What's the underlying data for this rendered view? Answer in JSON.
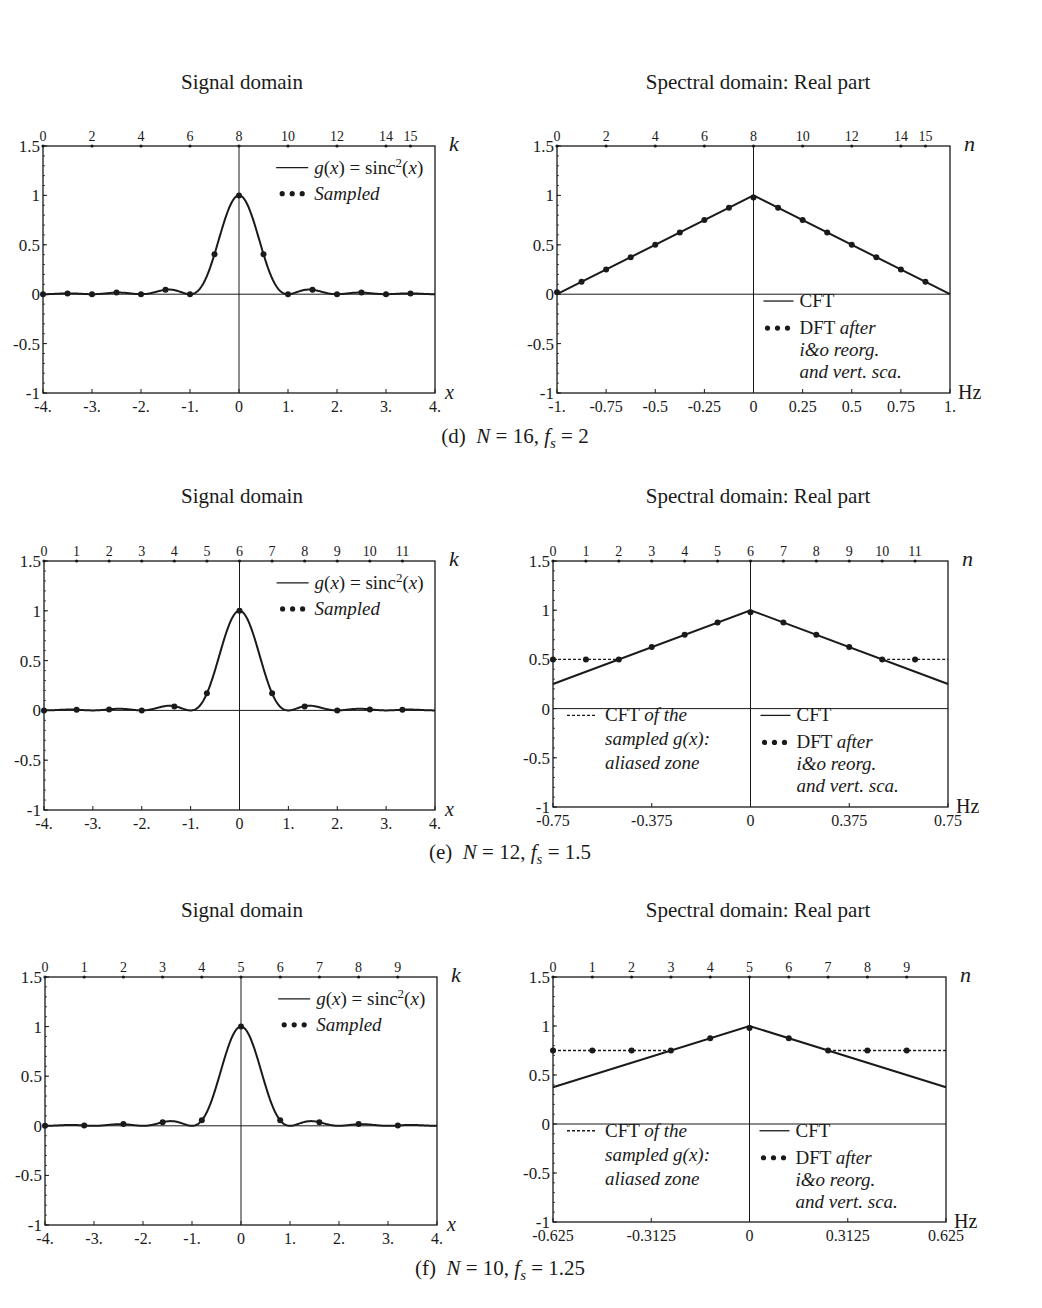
{
  "panels": [
    {
      "id": "d",
      "caption": {
        "label": "(d)",
        "N": "16",
        "fs": "2"
      },
      "signal": {
        "title": "Signal domain"
      },
      "spectral": {
        "title": "Spectral domain: Real part"
      }
    },
    {
      "id": "e",
      "caption": {
        "label": "(e)",
        "N": "12",
        "fs": "1.5"
      },
      "signal": {
        "title": "Signal domain"
      },
      "spectral": {
        "title": "Spectral domain: Real part"
      }
    },
    {
      "id": "f",
      "caption": {
        "label": "(f)",
        "N": "10",
        "fs": "1.25"
      },
      "signal": {
        "title": "Signal domain"
      },
      "spectral": {
        "title": "Spectral domain: Real part"
      }
    }
  ],
  "legend": {
    "signal_line": "g(x) = sinc²(x)",
    "signal_dots": "Sampled",
    "cft": "CFT",
    "dft_main": "DFT",
    "dft_rest": [
      "after",
      "i&o reorg.",
      "and vert. sca."
    ],
    "alias_main": "CFT",
    "alias_rest": [
      "of the",
      "sampled g(x):",
      "aliased zone"
    ]
  },
  "chart_data": [
    {
      "type": "line",
      "panel": "d-signal",
      "title": "Signal domain",
      "xlabel": "x",
      "top_axis_label": "k",
      "ylabel": "",
      "xlim": [
        -4,
        4
      ],
      "ylim": [
        -1,
        1.5
      ],
      "xticks": [
        "-4.",
        "-3.",
        "-2.",
        "-1.",
        "0",
        "1.",
        "2.",
        "3.",
        "4."
      ],
      "yticks": [
        "-1",
        "-0.5",
        "0",
        "0.5",
        "1",
        "1.5"
      ],
      "top_ticks": [
        0,
        2,
        4,
        6,
        8,
        10,
        12,
        14,
        15
      ],
      "N": 16,
      "fs": 2,
      "series": [
        {
          "name": "g(x) = sinc²(x)",
          "style": "solid",
          "function": "sinc^2(x)"
        },
        {
          "name": "Sampled",
          "style": "dots",
          "x": [
            -4,
            -3.5,
            -3,
            -2.5,
            -2,
            -1.5,
            -1,
            -0.5,
            0,
            0.5,
            1,
            1.5,
            2,
            2.5,
            3,
            3.5
          ],
          "values": [
            0,
            0.008,
            0,
            0.016,
            0,
            0.045,
            0,
            0.405,
            1,
            0.405,
            0,
            0.045,
            0,
            0.016,
            0,
            0.008
          ]
        }
      ]
    },
    {
      "type": "line",
      "panel": "d-spectral",
      "title": "Spectral domain: Real part",
      "xlabel": "Hz",
      "top_axis_label": "n",
      "xlim": [
        -1,
        1
      ],
      "ylim": [
        -1,
        1.5
      ],
      "xticks": [
        "-1.",
        "-0.75",
        "-0.5",
        "-0.25",
        "0",
        "0.25",
        "0.5",
        "0.75",
        "1."
      ],
      "yticks": [
        "-1",
        "-0.5",
        "0",
        "0.5",
        "1",
        "1.5"
      ],
      "top_ticks": [
        0,
        2,
        4,
        6,
        8,
        10,
        12,
        14,
        15
      ],
      "N": 16,
      "fs": 2,
      "series": [
        {
          "name": "CFT",
          "style": "solid",
          "x": [
            -1,
            0,
            1
          ],
          "values": [
            0,
            1,
            0
          ]
        },
        {
          "name": "DFT after i&o reorg. and vert. sca.",
          "style": "dots",
          "x": [
            -1,
            -0.875,
            -0.75,
            -0.625,
            -0.5,
            -0.375,
            -0.25,
            -0.125,
            0,
            0.125,
            0.25,
            0.375,
            0.5,
            0.625,
            0.75,
            0.875
          ],
          "values": [
            0.02,
            0.125,
            0.25,
            0.375,
            0.5,
            0.625,
            0.75,
            0.875,
            0.98,
            0.875,
            0.75,
            0.625,
            0.5,
            0.375,
            0.25,
            0.125
          ]
        }
      ]
    },
    {
      "type": "line",
      "panel": "e-signal",
      "title": "Signal domain",
      "xlabel": "x",
      "top_axis_label": "k",
      "xlim": [
        -4,
        4
      ],
      "ylim": [
        -1,
        1.5
      ],
      "xticks": [
        "-4.",
        "-3.",
        "-2.",
        "-1.",
        "0",
        "1.",
        "2.",
        "3.",
        "4."
      ],
      "yticks": [
        "-1",
        "-0.5",
        "0",
        "0.5",
        "1",
        "1.5"
      ],
      "top_ticks": [
        0,
        1,
        2,
        3,
        4,
        5,
        6,
        7,
        8,
        9,
        10,
        11
      ],
      "N": 12,
      "fs": 1.5,
      "series": [
        {
          "name": "g(x) = sinc²(x)",
          "style": "solid",
          "function": "sinc^2(x)"
        },
        {
          "name": "Sampled",
          "style": "dots",
          "x": [
            -4,
            -3.333,
            -2.667,
            -2,
            -1.333,
            -0.667,
            0,
            0.667,
            1.333,
            2,
            2.667,
            3.333
          ],
          "values": [
            0,
            0.007,
            0.009,
            0,
            0.038,
            0.171,
            1,
            0.171,
            0.038,
            0,
            0.009,
            0.007
          ]
        }
      ]
    },
    {
      "type": "line",
      "panel": "e-spectral",
      "title": "Spectral domain: Real part",
      "xlabel": "Hz",
      "top_axis_label": "n",
      "xlim": [
        -0.75,
        0.75
      ],
      "ylim": [
        -1,
        1.5
      ],
      "xticks": [
        "-0.75",
        "-0.375",
        "0",
        "0.375",
        "0.75"
      ],
      "yticks": [
        "-1",
        "-0.5",
        "0",
        "0.5",
        "1",
        "1.5"
      ],
      "top_ticks": [
        0,
        1,
        2,
        3,
        4,
        5,
        6,
        7,
        8,
        9,
        10,
        11
      ],
      "N": 12,
      "fs": 1.5,
      "series": [
        {
          "name": "CFT",
          "style": "solid",
          "x": [
            -0.75,
            0,
            0.75
          ],
          "values": [
            0.25,
            1,
            0.25
          ]
        },
        {
          "name": "CFT of the sampled g(x): aliased zone",
          "style": "dashed",
          "x": [
            -0.75,
            -0.5,
            0.5,
            0.75
          ],
          "values": [
            0.5,
            0.5,
            0.5,
            0.5
          ]
        },
        {
          "name": "DFT after i&o reorg. and vert. sca.",
          "style": "dots",
          "x": [
            -0.75,
            -0.625,
            -0.5,
            -0.375,
            -0.25,
            -0.125,
            0,
            0.125,
            0.25,
            0.375,
            0.5,
            0.625
          ],
          "values": [
            0.5,
            0.5,
            0.5,
            0.625,
            0.75,
            0.875,
            0.98,
            0.875,
            0.75,
            0.625,
            0.5,
            0.5
          ]
        }
      ]
    },
    {
      "type": "line",
      "panel": "f-signal",
      "title": "Signal domain",
      "xlabel": "x",
      "top_axis_label": "k",
      "xlim": [
        -4,
        4
      ],
      "ylim": [
        -1,
        1.5
      ],
      "xticks": [
        "-4.",
        "-3.",
        "-2.",
        "-1.",
        "0",
        "1.",
        "2.",
        "3.",
        "4."
      ],
      "yticks": [
        "-1",
        "-0.5",
        "0",
        "0.5",
        "1",
        "1.5"
      ],
      "top_ticks": [
        0,
        1,
        2,
        3,
        4,
        5,
        6,
        7,
        8,
        9
      ],
      "N": 10,
      "fs": 1.25,
      "series": [
        {
          "name": "g(x) = sinc²(x)",
          "style": "solid",
          "function": "sinc^2(x)"
        },
        {
          "name": "Sampled",
          "style": "dots",
          "x": [
            -4,
            -3.2,
            -2.4,
            -1.6,
            -0.8,
            0,
            0.8,
            1.6,
            2.4,
            3.2
          ],
          "values": [
            0,
            0.003,
            0.018,
            0.036,
            0.055,
            1,
            0.055,
            0.036,
            0.018,
            0.003
          ]
        }
      ]
    },
    {
      "type": "line",
      "panel": "f-spectral",
      "title": "Spectral domain: Real part",
      "xlabel": "Hz",
      "top_axis_label": "n",
      "xlim": [
        -0.625,
        0.625
      ],
      "ylim": [
        -1,
        1.5
      ],
      "xticks": [
        "-0.625",
        "-0.3125",
        "0",
        "0.3125",
        "0.625"
      ],
      "yticks": [
        "-1",
        "-0.5",
        "0",
        "0.5",
        "1",
        "1.5"
      ],
      "top_ticks": [
        0,
        1,
        2,
        3,
        4,
        5,
        6,
        7,
        8,
        9
      ],
      "N": 10,
      "fs": 1.25,
      "series": [
        {
          "name": "CFT",
          "style": "solid",
          "x": [
            -0.625,
            0,
            0.625
          ],
          "values": [
            0.375,
            1,
            0.375
          ]
        },
        {
          "name": "CFT of the sampled g(x): aliased zone",
          "style": "dashed",
          "x": [
            -0.625,
            -0.25,
            0.25,
            0.625
          ],
          "values": [
            0.75,
            0.75,
            0.75,
            0.75
          ]
        },
        {
          "name": "DFT after i&o reorg. and vert. sca.",
          "style": "dots",
          "x": [
            -0.625,
            -0.5,
            -0.375,
            -0.25,
            -0.125,
            0,
            0.125,
            0.25,
            0.375,
            0.5
          ],
          "values": [
            0.75,
            0.75,
            0.75,
            0.75,
            0.875,
            0.98,
            0.875,
            0.75,
            0.75,
            0.75
          ]
        }
      ]
    }
  ]
}
